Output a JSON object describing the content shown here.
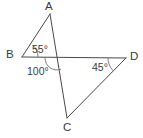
{
  "figure": {
    "type": "geometry-diagram",
    "stroke_color": "#4a4a4a",
    "arc_color": "#6e6e6e",
    "text_color": "#3b3b3b",
    "background_color": "#ffffff",
    "width": 143,
    "height": 138,
    "vertices": [
      {
        "name": "A",
        "label": "A",
        "x": 50,
        "y": 14,
        "label_x": 45,
        "label_y": 1
      },
      {
        "name": "B",
        "label": "B",
        "x": 22,
        "y": 57,
        "label_x": 6,
        "label_y": 49
      },
      {
        "name": "C",
        "label": "C",
        "x": 67,
        "y": 118,
        "label_x": 63,
        "label_y": 122
      },
      {
        "name": "D",
        "label": "D",
        "x": 126,
        "y": 58,
        "label_x": 130,
        "label_y": 51
      },
      {
        "name": "intersection",
        "label": "",
        "x": 57,
        "y": 58,
        "label_x": 0,
        "label_y": 0
      }
    ],
    "segments": [
      {
        "name": "segment-AB",
        "from": "A",
        "to": "B"
      },
      {
        "name": "segment-AC",
        "from": "A",
        "to": "C"
      },
      {
        "name": "segment-BD",
        "from": "B",
        "to": "D"
      },
      {
        "name": "segment-CD",
        "from": "C",
        "to": "D"
      }
    ],
    "angles": [
      {
        "name": "angle-at-B",
        "value": "55°",
        "vertex": "B",
        "label_x": 32,
        "label_y": 44
      },
      {
        "name": "angle-at-intersection",
        "value": "100°",
        "vertex": "intersection",
        "label_x": 27,
        "label_y": 66
      },
      {
        "name": "angle-at-D",
        "value": "45°",
        "vertex": "D",
        "label_x": 92,
        "label_y": 62
      }
    ]
  }
}
